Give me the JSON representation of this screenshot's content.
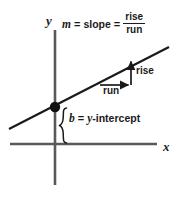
{
  "figure": {
    "ink_color": "#1a1a1a",
    "background": "#ffffff"
  },
  "axes": {
    "y_label": "y",
    "x_label": "x",
    "y_axis": {
      "x": 55,
      "y_top": 30,
      "y_bottom": 185
    },
    "x_axis": {
      "y": 144,
      "x_left": 10,
      "x_right": 157
    }
  },
  "line": {
    "label": "linear-function-graph",
    "x1": 9,
    "y1": 129,
    "x2": 169,
    "y2": 47
  },
  "intercept_point": {
    "cx": 55,
    "cy": 107,
    "r": 5
  },
  "formula": {
    "m_symbol": "m",
    "equals": "=",
    "slope_word": "slope",
    "equals2": "=",
    "numerator": "rise",
    "denominator": "run"
  },
  "triangle": {
    "run_label": "run",
    "rise_label": "rise",
    "run_arrow": {
      "x1": 100,
      "y1": 85,
      "x2": 131,
      "y2": 85
    },
    "rise_arrow": {
      "x1": 131,
      "y1": 85,
      "x2": 131,
      "y2": 59
    }
  },
  "intercept_annotation": {
    "b_symbol": "b",
    "equals": "=",
    "y_symbol": "y",
    "hyphen_word": "-intercept",
    "brace": {
      "x": 62,
      "y_top": 108,
      "y_bottom": 143
    }
  }
}
